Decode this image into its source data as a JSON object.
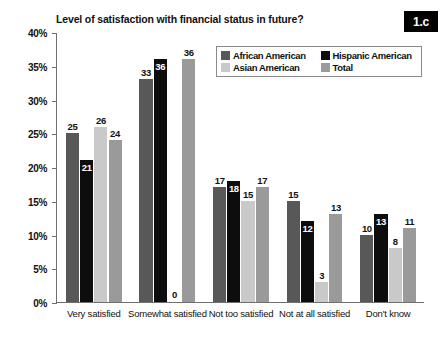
{
  "figure": {
    "badge": "1.c"
  },
  "chart_data": {
    "type": "bar",
    "title": "Level of satisfaction with financial status in future?",
    "xlabel": "",
    "ylabel": "",
    "ylim": [
      0,
      40
    ],
    "ytick_labels": [
      "0%",
      "5%",
      "10%",
      "15%",
      "20%",
      "25%",
      "30%",
      "35%",
      "40%"
    ],
    "ytick_values": [
      0,
      5,
      10,
      15,
      20,
      25,
      30,
      35,
      40
    ],
    "grid": false,
    "legend_position": "top-right-inside",
    "categories": [
      "Very satisfied",
      "Somewhat satisfied",
      "Not too satisfied",
      "Not at all satisfied",
      "Don't know"
    ],
    "series": [
      {
        "name": "African American",
        "color": "#585858",
        "values": [
          25,
          33,
          17,
          15,
          10
        ]
      },
      {
        "name": "Hispanic American",
        "color": "#0d0d0d",
        "values": [
          21,
          36,
          18,
          12,
          13
        ]
      },
      {
        "name": "Asian American",
        "color": "#c9c9c9",
        "values": [
          26,
          0,
          15,
          3,
          8
        ]
      },
      {
        "name": "Total",
        "color": "#9a9a9a",
        "values": [
          24,
          36,
          17,
          13,
          11
        ]
      }
    ]
  }
}
